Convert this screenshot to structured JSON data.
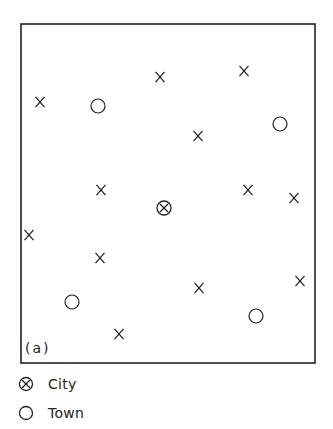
{
  "figure": {
    "panel_label": "(a)",
    "frame": {
      "x1": 21,
      "y1": 24,
      "x2": 315,
      "y2": 363
    },
    "settlements": [
      {
        "type": "village",
        "x": 40,
        "y": 102
      },
      {
        "type": "town",
        "x": 98,
        "y": 106
      },
      {
        "type": "village",
        "x": 160,
        "y": 77
      },
      {
        "type": "village",
        "x": 244,
        "y": 71
      },
      {
        "type": "village",
        "x": 198,
        "y": 136
      },
      {
        "type": "town",
        "x": 280,
        "y": 124
      },
      {
        "type": "village",
        "x": 101,
        "y": 190
      },
      {
        "type": "city",
        "x": 164,
        "y": 208
      },
      {
        "type": "village",
        "x": 248,
        "y": 190
      },
      {
        "type": "village",
        "x": 294,
        "y": 198
      },
      {
        "type": "village",
        "x": 29,
        "y": 235
      },
      {
        "type": "village",
        "x": 100,
        "y": 258
      },
      {
        "type": "village",
        "x": 199,
        "y": 288
      },
      {
        "type": "village",
        "x": 300,
        "y": 281
      },
      {
        "type": "town",
        "x": 72,
        "y": 302
      },
      {
        "type": "town",
        "x": 256,
        "y": 316
      },
      {
        "type": "village",
        "x": 119,
        "y": 334
      }
    ]
  },
  "legend": {
    "items": [
      {
        "symbol": "city-symbol",
        "label": "City"
      },
      {
        "symbol": "town-symbol",
        "label": "Town"
      }
    ]
  },
  "colors": {
    "ink": "#222222",
    "background": "#ffffff"
  }
}
